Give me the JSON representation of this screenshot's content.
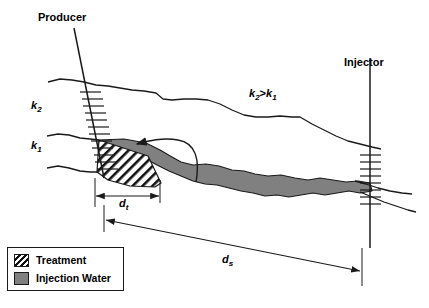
{
  "figure": {
    "title_hidden": "",
    "wells": [
      {
        "name": "producer",
        "label": "Producer"
      },
      {
        "name": "injector",
        "label": "Injector"
      }
    ],
    "layers": [
      {
        "name": "upper-layer",
        "label": "k",
        "sub": "2"
      },
      {
        "name": "lower-layer",
        "label": "k",
        "sub": "1"
      }
    ],
    "annotation": {
      "left": "k",
      "left_sub": "2",
      "operator": ">",
      "right": "k",
      "right_sub": "1"
    },
    "dimensions": [
      {
        "name": "treatment-distance",
        "label": "d",
        "sub": "t"
      },
      {
        "name": "separation-distance",
        "label": "d",
        "sub": "s"
      }
    ],
    "flow_arrow": {
      "name": "flow-direction-arrow",
      "direction": "left"
    }
  },
  "legend": {
    "items": [
      {
        "label": "Treatment",
        "pattern": "hatch",
        "color": "#111111"
      },
      {
        "label": "Injection Water",
        "pattern": "solid",
        "color": "#808080"
      }
    ]
  },
  "colors": {
    "line": "#1a1a1a",
    "injection_water": "#808080",
    "treatment_hatch": "#111111",
    "background": "#ffffff"
  }
}
